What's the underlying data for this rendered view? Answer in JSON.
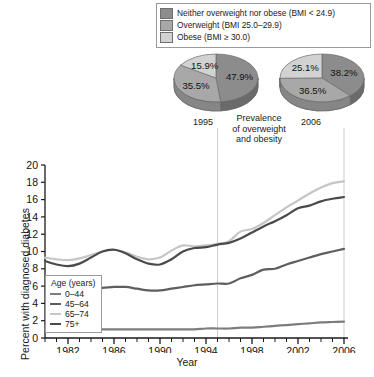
{
  "pie_legend": {
    "items": [
      {
        "label": "Neither overweight nor obese (BMI < 24.9)",
        "color": "#8c8c8c"
      },
      {
        "label": "Overweight (BMI 25.0–29.9)",
        "color": "#a8a8a8"
      },
      {
        "label": "Obese (BMI ≥ 30.0)",
        "color": "#d2d2d2"
      }
    ]
  },
  "pies": {
    "caption": {
      "line1": "Prevalence",
      "line2": "of overweight",
      "line3": "and obesity"
    },
    "charts": [
      {
        "year": "1995",
        "values": [
          47.9,
          35.5,
          15.9
        ],
        "labels": [
          "47.9%",
          "35.5%",
          "15.9%"
        ]
      },
      {
        "year": "2006",
        "values": [
          38.2,
          36.5,
          25.1
        ],
        "labels": [
          "38.2%",
          "36.5%",
          "25.1%"
        ]
      }
    ]
  },
  "chart_data": {
    "type": "line",
    "title": "",
    "xlabel": "Year",
    "ylabel": "Percent with diagnosed diabetes",
    "xlim": [
      1980,
      2006
    ],
    "ylim": [
      0,
      20
    ],
    "yticks": [
      0,
      2,
      4,
      6,
      8,
      10,
      12,
      14,
      16,
      18,
      20
    ],
    "xticks": [
      1982,
      1986,
      1990,
      1994,
      1998,
      2002,
      2006
    ],
    "xtick_labels": [
      "1982",
      "1986",
      "1990",
      "1994",
      "1998",
      "2002",
      "2006"
    ],
    "grid": false,
    "legend_position": "top-left",
    "legend_title": "Age (years)",
    "annotations": [
      {
        "type": "vline",
        "x": 1995,
        "label": "1995"
      },
      {
        "type": "vline",
        "x": 2006,
        "label": "2006"
      }
    ],
    "x": [
      1980,
      1981,
      1982,
      1983,
      1984,
      1985,
      1986,
      1987,
      1988,
      1989,
      1990,
      1991,
      1992,
      1993,
      1994,
      1995,
      1996,
      1997,
      1998,
      1999,
      2000,
      2001,
      2002,
      2003,
      2004,
      2005,
      2006
    ],
    "series": [
      {
        "name": "0–44",
        "color": "#7d7d7d",
        "values": [
          1.0,
          1.0,
          1.0,
          1.0,
          1.0,
          1.0,
          1.0,
          1.0,
          1.0,
          1.0,
          1.0,
          1.0,
          1.0,
          1.0,
          1.1,
          1.1,
          1.1,
          1.2,
          1.2,
          1.3,
          1.4,
          1.5,
          1.6,
          1.7,
          1.8,
          1.85,
          1.9
        ]
      },
      {
        "name": "45–64",
        "color": "#5e5e5e",
        "values": [
          5.6,
          5.7,
          5.8,
          5.8,
          5.8,
          5.8,
          5.9,
          5.9,
          5.7,
          5.5,
          5.5,
          5.7,
          5.9,
          6.1,
          6.2,
          6.3,
          6.3,
          6.9,
          7.3,
          7.9,
          8.0,
          8.5,
          8.9,
          9.3,
          9.7,
          10.0,
          10.3
        ]
      },
      {
        "name": "65–74",
        "color": "#c6c6c6",
        "values": [
          9.3,
          9.1,
          9.0,
          9.2,
          9.6,
          10.0,
          10.2,
          9.9,
          9.4,
          9.1,
          9.3,
          10.1,
          10.7,
          10.6,
          10.7,
          10.9,
          11.2,
          12.3,
          12.6,
          13.3,
          14.2,
          15.1,
          15.9,
          16.7,
          17.4,
          17.9,
          18.1
        ]
      },
      {
        "name": "75+",
        "color": "#4a4a4a",
        "values": [
          8.9,
          8.5,
          8.3,
          8.6,
          9.3,
          10.0,
          10.2,
          9.8,
          9.1,
          8.6,
          8.5,
          9.1,
          10.0,
          10.4,
          10.5,
          10.8,
          11.0,
          11.5,
          12.2,
          12.9,
          13.5,
          14.2,
          15.0,
          15.3,
          15.8,
          16.1,
          16.3
        ]
      }
    ]
  }
}
